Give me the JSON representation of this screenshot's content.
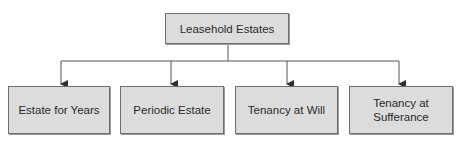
{
  "diagram": {
    "colors": {
      "box_fill": "#dcdcdc",
      "box_border": "#6e6e6e",
      "line": "#555555",
      "text": "#2a2a2a",
      "background": "#ffffff"
    },
    "root": {
      "label": "Leasehold Estates"
    },
    "children": [
      {
        "label": "Estate for Years"
      },
      {
        "label": "Periodic Estate"
      },
      {
        "label": "Tenancy at Will"
      },
      {
        "label": "Tenancy at\nSufferance"
      }
    ]
  }
}
